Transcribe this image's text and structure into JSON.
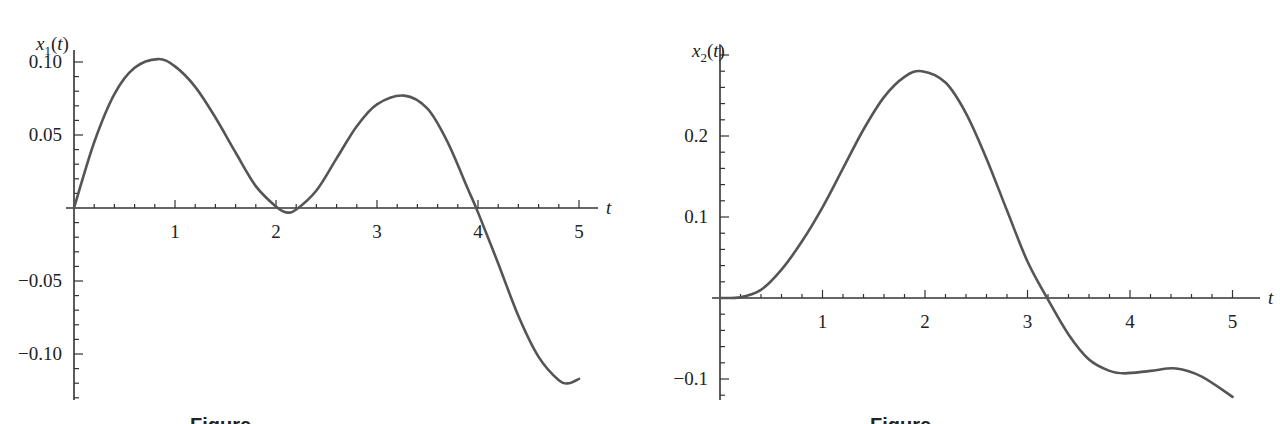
{
  "chart_data": [
    {
      "type": "line",
      "title": "",
      "xlabel": "t",
      "ylabel": "x1(t)",
      "ylabel_base": "x",
      "ylabel_sub": "1",
      "ylabel_arg": "(t)",
      "xlim": [
        0,
        5.2
      ],
      "ylim": [
        -0.125,
        0.11
      ],
      "grid": false,
      "x_ticks": [
        1,
        2,
        3,
        4,
        5
      ],
      "x_tick_labels": [
        "1",
        "2",
        "3",
        "4",
        "5"
      ],
      "y_ticks": [
        0.1,
        0.05,
        -0.05,
        -0.1
      ],
      "y_tick_labels": [
        "0.10",
        "0.05",
        "−0.05",
        "−0.10"
      ],
      "series": [
        {
          "name": "x1(t)",
          "x": [
            0,
            0.2,
            0.4,
            0.6,
            0.83,
            1.0,
            1.2,
            1.4,
            1.6,
            1.8,
            2.0,
            2.1,
            2.2,
            2.4,
            2.6,
            2.8,
            3.0,
            3.27,
            3.5,
            3.7,
            3.9,
            4.0,
            4.2,
            4.4,
            4.6,
            4.8,
            4.9,
            5.0
          ],
          "y": [
            0,
            0.045,
            0.078,
            0.096,
            0.102,
            0.097,
            0.083,
            0.062,
            0.038,
            0.015,
            0.001,
            -0.003,
            -0.001,
            0.012,
            0.034,
            0.056,
            0.071,
            0.077,
            0.068,
            0.045,
            0.013,
            -0.003,
            -0.038,
            -0.074,
            -0.102,
            -0.118,
            -0.12,
            -0.117
          ]
        }
      ]
    },
    {
      "type": "line",
      "title": "",
      "xlabel": "t",
      "ylabel": "x2(t)",
      "ylabel_base": "x",
      "ylabel_sub": "2",
      "ylabel_arg": "(t)",
      "xlim": [
        0,
        5.2
      ],
      "ylim": [
        -0.125,
        0.31
      ],
      "grid": false,
      "x_ticks": [
        1,
        2,
        3,
        4,
        5
      ],
      "x_tick_labels": [
        "1",
        "2",
        "3",
        "4",
        "5"
      ],
      "y_ticks": [
        0.2,
        0.1,
        -0.1
      ],
      "y_tick_labels": [
        "0.2",
        "0.1",
        "−0.1"
      ],
      "series": [
        {
          "name": "x2(t)",
          "x": [
            0,
            0.2,
            0.4,
            0.6,
            0.8,
            1.0,
            1.2,
            1.4,
            1.6,
            1.8,
            1.97,
            2.2,
            2.4,
            2.6,
            2.8,
            3.0,
            3.2,
            3.4,
            3.6,
            3.8,
            3.95,
            4.2,
            4.45,
            4.7,
            5.0
          ],
          "y": [
            0,
            0.001,
            0.01,
            0.035,
            0.07,
            0.112,
            0.16,
            0.208,
            0.248,
            0.273,
            0.28,
            0.266,
            0.228,
            0.172,
            0.108,
            0.045,
            -0.002,
            -0.045,
            -0.076,
            -0.09,
            -0.093,
            -0.09,
            -0.087,
            -0.097,
            -0.122
          ]
        }
      ]
    }
  ],
  "captions": [
    "Figure",
    "Figure"
  ]
}
